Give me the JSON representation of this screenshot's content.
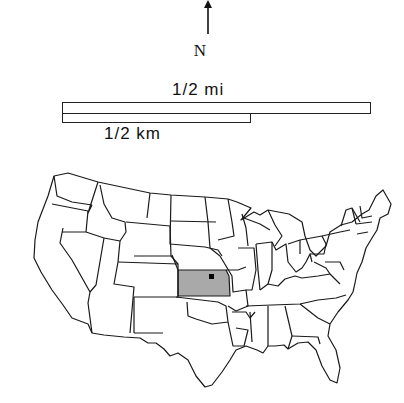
{
  "north_arrow": {
    "label": "N"
  },
  "scale_bars": [
    {
      "label": "1/2 mi",
      "units": "miles",
      "length": "1/2"
    },
    {
      "label": "1/2 km",
      "units": "kilometers",
      "length": "1/2"
    }
  ],
  "map": {
    "region": "Contiguous United States",
    "highlighted_state": "Kansas",
    "highlight_color": "#a9a9a9",
    "outline_color": "#1a1a1a",
    "marker": {
      "shape": "square",
      "color": "#000000",
      "state": "Kansas"
    }
  }
}
